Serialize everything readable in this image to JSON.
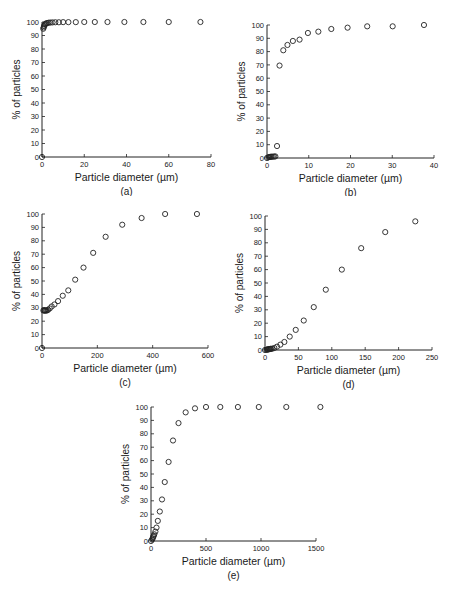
{
  "chart_data": [
    {
      "id": "a",
      "type": "scatter",
      "caption": "(a)",
      "xlabel": "Particle diameter (µm)",
      "ylabel": "% of particles",
      "xlim": [
        0,
        80
      ],
      "ylim": [
        0,
        100
      ],
      "xticks": [
        0,
        20,
        40,
        60,
        80
      ],
      "yticks": [
        0,
        10,
        20,
        30,
        40,
        50,
        60,
        70,
        80,
        90,
        100
      ],
      "grid": false,
      "marker": "open-circle",
      "x": [
        0,
        0.6,
        0.8,
        1.0,
        1.3,
        1.6,
        2.0,
        2.5,
        3.2,
        4.0,
        5.0,
        6.3,
        8.0,
        10.0,
        12.5,
        16.0,
        20.0,
        25.0,
        31.0,
        39.0,
        48.0,
        60.0,
        75.0
      ],
      "y": [
        0,
        95,
        96,
        97,
        98,
        98.5,
        99,
        99.2,
        99.5,
        99.6,
        99.7,
        99.8,
        99.8,
        99.9,
        99.9,
        99.9,
        100,
        100,
        100,
        100,
        100,
        100,
        100
      ]
    },
    {
      "id": "b",
      "type": "scatter",
      "caption": "(b)",
      "xlabel": "Particle diameter (µm)",
      "ylabel": "% of particles",
      "xlim": [
        0,
        40
      ],
      "ylim": [
        0,
        100
      ],
      "xticks": [
        0,
        10,
        20,
        30,
        40
      ],
      "yticks": [
        0,
        10,
        20,
        30,
        40,
        50,
        60,
        70,
        80,
        90,
        100
      ],
      "grid": false,
      "marker": "open-circle",
      "x": [
        0,
        0.3,
        0.5,
        0.7,
        0.9,
        1.1,
        1.4,
        1.7,
        2.0,
        2.4,
        3.0,
        3.9,
        4.9,
        6.2,
        7.8,
        9.8,
        12.3,
        15.4,
        19.3,
        24.0,
        30.1,
        37.6
      ],
      "y": [
        0,
        0.5,
        0.7,
        0.8,
        0.9,
        1.0,
        1.0,
        1.1,
        1.2,
        9,
        69.5,
        81,
        85,
        88,
        89,
        94,
        95,
        97,
        98,
        99,
        99,
        100
      ]
    },
    {
      "id": "c",
      "type": "scatter",
      "caption": "(c)",
      "xlabel": "Particle diameter (µm)",
      "ylabel": "% of particles",
      "xlim": [
        0,
        600
      ],
      "ylim": [
        0,
        100
      ],
      "xticks": [
        0,
        200,
        400,
        600
      ],
      "yticks": [
        0,
        10,
        20,
        30,
        40,
        50,
        60,
        70,
        80,
        90,
        100
      ],
      "grid": false,
      "marker": "open-circle",
      "x": [
        0,
        5,
        8,
        10,
        12,
        15,
        18,
        22,
        28,
        35,
        45,
        58,
        75,
        95,
        120,
        150,
        185,
        230,
        290,
        360,
        445,
        560
      ],
      "y": [
        0,
        28,
        28,
        28,
        28,
        28,
        28,
        28.5,
        29.5,
        31,
        32.5,
        35,
        39,
        43,
        51,
        60,
        71,
        83,
        92,
        97,
        100,
        100
      ]
    },
    {
      "id": "d",
      "type": "scatter",
      "caption": "(d)",
      "xlabel": "Particle diameter (µm)",
      "ylabel": "% of particles",
      "xlim": [
        0,
        250
      ],
      "ylim": [
        0,
        100
      ],
      "xticks": [
        0,
        50,
        100,
        150,
        200,
        250
      ],
      "yticks": [
        0,
        10,
        20,
        30,
        40,
        50,
        60,
        70,
        80,
        90,
        100
      ],
      "grid": false,
      "marker": "open-circle",
      "x": [
        0,
        2,
        3,
        4,
        5,
        6,
        7,
        8,
        9,
        11,
        14,
        18,
        23,
        29,
        37,
        46,
        58,
        73,
        91,
        115,
        144,
        180,
        225
      ],
      "y": [
        0,
        0.2,
        0.3,
        0.4,
        0.5,
        0.6,
        0.7,
        0.8,
        0.9,
        1.0,
        1.5,
        2.5,
        4,
        6,
        10,
        15,
        22,
        32,
        45,
        60,
        76,
        88,
        96
      ]
    },
    {
      "id": "e",
      "type": "scatter",
      "caption": "(e)",
      "xlabel": "Particle diameter (µm)",
      "ylabel": "% of particles",
      "xlim": [
        0,
        1500
      ],
      "ylim": [
        0,
        100
      ],
      "xticks": [
        0,
        500,
        1000,
        1500
      ],
      "yticks": [
        0,
        10,
        20,
        30,
        40,
        50,
        60,
        70,
        80,
        90,
        100
      ],
      "grid": false,
      "marker": "open-circle",
      "x": [
        0,
        10,
        15,
        20,
        25,
        30,
        40,
        50,
        62,
        80,
        100,
        125,
        160,
        200,
        250,
        315,
        400,
        500,
        630,
        790,
        980,
        1230,
        1540
      ],
      "y": [
        0,
        1,
        2,
        3,
        4,
        5,
        7,
        10,
        15,
        22,
        31,
        44,
        59,
        75,
        88,
        96,
        99,
        100,
        100,
        100,
        100,
        100,
        100
      ]
    }
  ]
}
